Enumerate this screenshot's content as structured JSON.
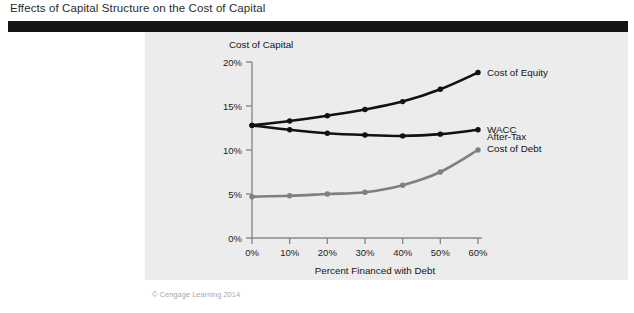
{
  "figure": {
    "title": "Effects of Capital Structure on the Cost of Capital",
    "copyright": "© Cengage Learning 2014"
  },
  "colors": {
    "header_bar": "#151515",
    "panel_background": "#ececec",
    "page_background": "#ffffff",
    "equity_line": "#111111",
    "wacc_line": "#111111",
    "debt_line": "#7f7f7f",
    "axis": "#8a8a8a",
    "text": "#141414"
  },
  "chart_data": {
    "type": "line",
    "title": "",
    "xlabel": "Percent Financed with Debt",
    "ylabel": "Cost of Capital",
    "x": [
      0,
      10,
      20,
      30,
      40,
      50,
      60
    ],
    "x_tick_labels": [
      "0%",
      "10%",
      "20%",
      "30%",
      "40%",
      "50%",
      "60%"
    ],
    "y_tick_values": [
      0,
      5,
      10,
      15,
      20
    ],
    "y_tick_labels": [
      "0%",
      "5%",
      "10%",
      "15%",
      "20%"
    ],
    "xlim": [
      0,
      60
    ],
    "ylim": [
      0,
      20
    ],
    "grid": false,
    "legend_position": "right-inline-labels",
    "series": [
      {
        "name": "Cost of Equity",
        "color": "#111111",
        "values": [
          12.8,
          13.3,
          13.9,
          14.6,
          15.5,
          16.9,
          18.8
        ]
      },
      {
        "name": "WACC",
        "color": "#111111",
        "values": [
          12.8,
          12.3,
          11.9,
          11.7,
          11.6,
          11.8,
          12.3
        ]
      },
      {
        "name": "After-Tax\nCost of Debt",
        "label_line1": "After-Tax",
        "label_line2": "Cost of Debt",
        "color": "#7f7f7f",
        "values": [
          4.7,
          4.8,
          5.0,
          5.2,
          6.0,
          7.5,
          10.0
        ]
      }
    ]
  }
}
